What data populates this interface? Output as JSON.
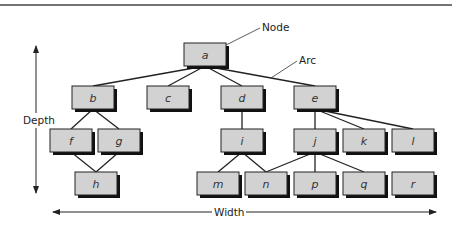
{
  "labels": {
    "node_callout": "Node",
    "arc_callout": "Arc",
    "depth_axis": "Depth",
    "width_axis": "Width"
  },
  "colors": {
    "node_fill": "#d2d2d2",
    "node_border": "#222222",
    "shadow": "#111111",
    "line": "#222222"
  },
  "tree": {
    "nodes": [
      {
        "id": "a",
        "label": "a",
        "level": 0
      },
      {
        "id": "b",
        "label": "b",
        "level": 1
      },
      {
        "id": "c",
        "label": "c",
        "level": 1
      },
      {
        "id": "d",
        "label": "d",
        "level": 1
      },
      {
        "id": "e",
        "label": "e",
        "level": 1
      },
      {
        "id": "f",
        "label": "f",
        "level": 2
      },
      {
        "id": "g",
        "label": "g",
        "level": 2
      },
      {
        "id": "i",
        "label": "i",
        "level": 2
      },
      {
        "id": "j",
        "label": "j",
        "level": 2
      },
      {
        "id": "k",
        "label": "k",
        "level": 2
      },
      {
        "id": "l",
        "label": "l",
        "level": 2
      },
      {
        "id": "h",
        "label": "h",
        "level": 3
      },
      {
        "id": "m",
        "label": "m",
        "level": 3
      },
      {
        "id": "n",
        "label": "n",
        "level": 3
      },
      {
        "id": "p",
        "label": "p",
        "level": 3
      },
      {
        "id": "q",
        "label": "q",
        "level": 3
      },
      {
        "id": "r",
        "label": "r",
        "level": 3
      }
    ],
    "edges": [
      [
        "a",
        "b"
      ],
      [
        "a",
        "c"
      ],
      [
        "a",
        "d"
      ],
      [
        "a",
        "e"
      ],
      [
        "b",
        "f"
      ],
      [
        "b",
        "g"
      ],
      [
        "f",
        "h"
      ],
      [
        "g",
        "h"
      ],
      [
        "d",
        "i"
      ],
      [
        "e",
        "j"
      ],
      [
        "e",
        "k"
      ],
      [
        "e",
        "l"
      ],
      [
        "i",
        "m"
      ],
      [
        "i",
        "n"
      ],
      [
        "j",
        "n"
      ],
      [
        "j",
        "p"
      ],
      [
        "j",
        "q"
      ]
    ]
  }
}
